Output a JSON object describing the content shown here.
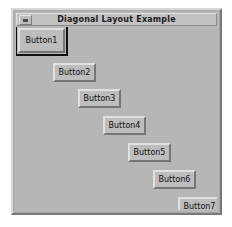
{
  "window": {
    "title": "Diagonal Layout Example",
    "menu_button_icon": "window-menu-icon",
    "frame_color": "#b6b6b6",
    "titlebar_color": "#c2c2c2",
    "desktop_color": "#ffffff"
  },
  "buttons": [
    {
      "label": "Button1",
      "x": 2,
      "y": 1,
      "w": 47,
      "h": 25,
      "focused": true
    },
    {
      "label": "Button2",
      "x": 37,
      "y": 36,
      "w": 43,
      "h": 19,
      "focused": false
    },
    {
      "label": "Button3",
      "x": 62,
      "y": 62,
      "w": 43,
      "h": 19,
      "focused": false
    },
    {
      "label": "Button4",
      "x": 87,
      "y": 89,
      "w": 43,
      "h": 19,
      "focused": false
    },
    {
      "label": "Button5",
      "x": 112,
      "y": 116,
      "w": 43,
      "h": 19,
      "focused": false
    },
    {
      "label": "Button6",
      "x": 137,
      "y": 143,
      "w": 43,
      "h": 19,
      "focused": false
    },
    {
      "label": "Button7",
      "x": 162,
      "y": 170,
      "w": 43,
      "h": 19,
      "focused": false
    }
  ]
}
